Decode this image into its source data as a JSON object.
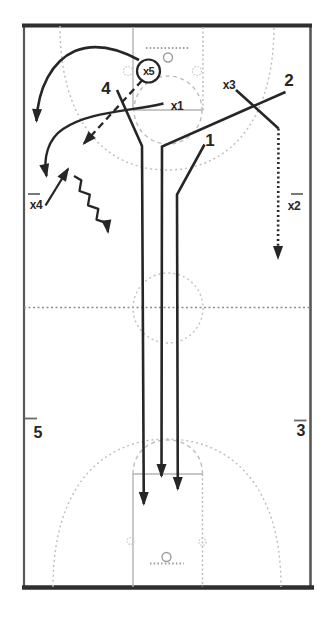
{
  "diagram": {
    "type": "basketball-full-court-play",
    "ink_color": "#262626",
    "court_line_color": "#b3b3b3",
    "background": "#ffffff",
    "players": [
      {
        "id": "x5",
        "label": "x5",
        "circled": true
      },
      {
        "id": "4",
        "label": "4",
        "circled": false
      },
      {
        "id": "x1",
        "label": "x1",
        "circled": false
      },
      {
        "id": "x3",
        "label": "x3",
        "circled": false
      },
      {
        "id": "2",
        "label": "2",
        "circled": false
      },
      {
        "id": "1",
        "label": "1",
        "circled": false
      },
      {
        "id": "x4",
        "label": "x4",
        "circled": false
      },
      {
        "id": "x2",
        "label": "x2",
        "circled": false
      },
      {
        "id": "5",
        "label": "5",
        "circled": false
      },
      {
        "id": "3",
        "label": "3",
        "circled": false
      }
    ]
  }
}
